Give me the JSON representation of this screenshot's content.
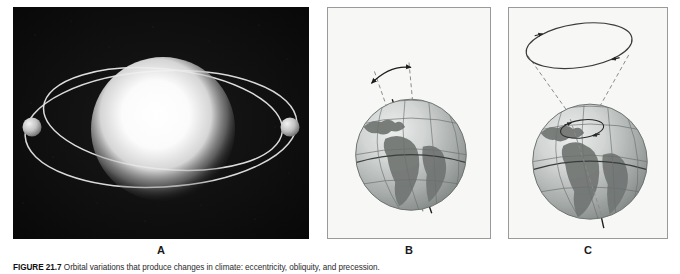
{
  "figure": {
    "caption_number": "FIGURE 21.7",
    "caption_text": "Orbital variations that produce changes in climate: eccentricity, obliquity, and precession.",
    "background_color": "#ffffff"
  },
  "panels": [
    {
      "id": "a",
      "label": "A",
      "title": "Eccentricity",
      "background_color": "#0d0d0d",
      "description": "A bright star at center with two intersecting elliptical orbits and two small planets.",
      "elements": {
        "star_color": "#ffffff",
        "orbit_color": "#d8d8d8",
        "planet_color": "#cfcfcf",
        "planet_count": 2,
        "orbit_count": 2
      }
    },
    {
      "id": "b",
      "label": "B",
      "title": "Obliquity",
      "background_color": "#f7f7f5",
      "border_color": "#9a9a98",
      "description": "Earth globe with tilted rotation axis and a curved double headed arrow between two dashed axis positions showing the change in tilt angle.",
      "elements": {
        "globe_light": "#d7d9d8",
        "globe_dark": "#8d9391",
        "land_color": "#6f7573",
        "graticule_color": "#6a706e",
        "axis_color": "#1c1c1c",
        "dashed_color": "#7d7d7d",
        "arrow_color": "#1c1c1c",
        "arrow_heads": 2,
        "dashed_axis_count": 2
      }
    },
    {
      "id": "c",
      "label": "C",
      "title": "Precession",
      "background_color": "#f7f7f5",
      "border_color": "#9a9a98",
      "description": "Earth globe whose axis sweeps out a cone; a large ellipse at the top of the cone and a small ellipse at the north pole both carry direction arrows.",
      "elements": {
        "globe_light": "#d7d9d8",
        "globe_dark": "#8d9391",
        "land_color": "#6f7573",
        "graticule_color": "#6a706e",
        "axis_color": "#1c1c1c",
        "cone_dashed_color": "#8a8a8a",
        "ellipse_color": "#3a3a3a",
        "large_ellipse_arrows": 2,
        "small_ellipse_arrows": 2
      }
    }
  ]
}
